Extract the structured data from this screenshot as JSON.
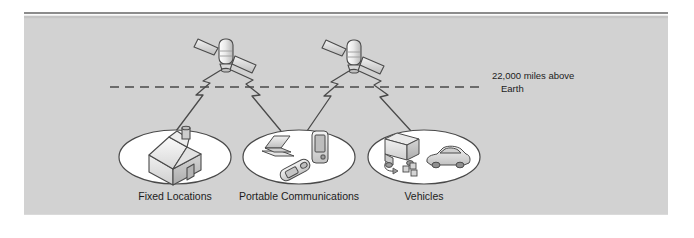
{
  "figure": {
    "name": "satellite-communication-diagram",
    "background_color": "#d2d2d2",
    "page_color": "#ffffff",
    "rule_color": "#808080",
    "stroke_color": "#4a4a4a",
    "ellipse_fill": "#ffffff",
    "text_color": "#1c1c1c"
  },
  "orbit": {
    "line_style": "dashed",
    "label_line1": "22,000 miles above",
    "label_line2": "Earth"
  },
  "satellites": [
    {
      "name": "satellite-left",
      "icon": "satellite-icon"
    },
    {
      "name": "satellite-right",
      "icon": "satellite-icon"
    }
  ],
  "groups": [
    {
      "label": "Fixed Locations",
      "icons": [
        "house-icon"
      ]
    },
    {
      "label": "Portable Communications",
      "icons": [
        "laptop-icon",
        "flip-phone-icon",
        "pda-icon"
      ]
    },
    {
      "label": "Vehicles",
      "icons": [
        "truck-icon",
        "car-icon"
      ]
    }
  ],
  "signals": {
    "connector_icon": "lightning-bolt-icon",
    "count": 4
  }
}
